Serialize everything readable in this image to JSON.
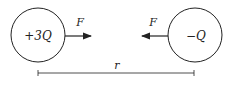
{
  "diagram": {
    "left_charge": {
      "label": "+3Q",
      "cx": 38,
      "cy": 35,
      "r": 27
    },
    "right_charge": {
      "label": "−Q",
      "cx": 195,
      "cy": 35,
      "r": 27
    },
    "left_force": {
      "label": "F",
      "direction": "right"
    },
    "right_force": {
      "label": "F",
      "direction": "left"
    },
    "distance": {
      "label": "r"
    },
    "colors": {
      "stroke": "#222222",
      "background": "#ffffff"
    }
  }
}
